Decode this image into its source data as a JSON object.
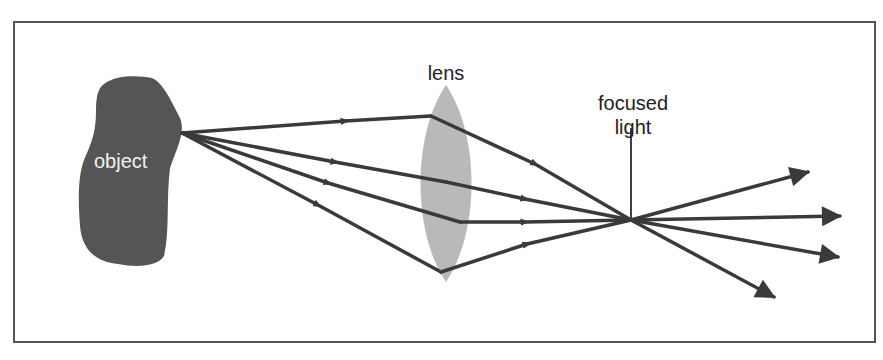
{
  "diagram": {
    "labels": {
      "object": "object",
      "lens": "lens",
      "focused_light_line1": "focused",
      "focused_light_line2": "light"
    },
    "colors": {
      "object_fill": "#555555",
      "lens_fill": "#b9b9b9",
      "ray_stroke": "#3a3a3a",
      "frame_stroke": "#555555"
    },
    "rays": [
      {
        "name": "ray-1",
        "passes_lens": "top"
      },
      {
        "name": "ray-2",
        "passes_lens": "upper-middle"
      },
      {
        "name": "ray-3",
        "passes_lens": "lower-middle"
      },
      {
        "name": "ray-4",
        "passes_lens": "bottom"
      }
    ]
  }
}
